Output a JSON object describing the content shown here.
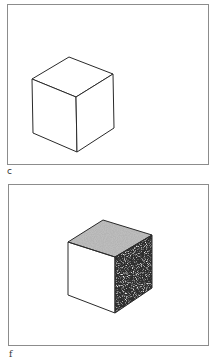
{
  "figure": {
    "panels": [
      {
        "label": "c",
        "description": "Line-drawn isometric cube, all faces blank (white)",
        "faces": {
          "top": "white",
          "front_left": "white",
          "right": "white"
        }
      },
      {
        "label": "f",
        "description": "Isometric cube with textured faces: top face light gray stipple, right face dark stipple, front-left face white",
        "faces": {
          "top": "light-gray-stipple",
          "front_left": "white",
          "right": "dark-stipple"
        }
      }
    ]
  },
  "colors": {
    "line": "#2a2a2a",
    "frame": "#8c8c8c",
    "top_texture": "#9b9b9b",
    "right_texture": "#3c3c3c",
    "background": "#ffffff"
  }
}
